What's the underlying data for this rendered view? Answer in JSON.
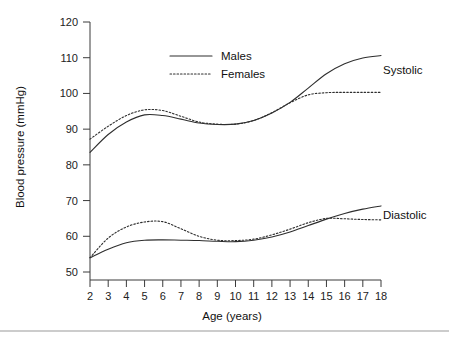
{
  "chart_data": {
    "type": "line",
    "title": "",
    "xlabel": "Age (years)",
    "ylabel": "Blood pressure (mmHg)",
    "xlim": [
      2,
      18
    ],
    "ylim": [
      50,
      120
    ],
    "grid": false,
    "legend_position": "top-center",
    "x_ticks": [
      "2",
      "3",
      "4",
      "5",
      "6",
      "7",
      "8",
      "9",
      "10",
      "11",
      "12",
      "13",
      "14",
      "15",
      "16",
      "17",
      "18"
    ],
    "y_ticks": [
      "50",
      "60",
      "70",
      "80",
      "90",
      "100",
      "110",
      "120"
    ],
    "legend": [
      {
        "name": "Males",
        "style": "solid"
      },
      {
        "name": "Females",
        "style": "dotted"
      }
    ],
    "group_labels": [
      {
        "name": "Systolic",
        "value_label": "Systolic"
      },
      {
        "name": "Diastolic",
        "value_label": "Diastolic"
      }
    ],
    "x": [
      2,
      3,
      4,
      5,
      6,
      7,
      8,
      9,
      10,
      11,
      12,
      13,
      14,
      15,
      16,
      17,
      18
    ],
    "series": [
      {
        "name": "Systolic Males",
        "group": "Systolic",
        "sex": "Males",
        "style": "solid",
        "values": [
          83.5,
          88.5,
          92.0,
          94.0,
          93.8,
          92.8,
          91.7,
          91.3,
          91.4,
          92.4,
          94.5,
          97.5,
          101.5,
          105.5,
          108.3,
          109.9,
          110.6
        ]
      },
      {
        "name": "Systolic Females",
        "group": "Systolic",
        "sex": "Females",
        "style": "dotted",
        "values": [
          87.2,
          90.8,
          93.8,
          95.4,
          95.2,
          93.6,
          92.0,
          91.4,
          91.4,
          92.4,
          94.6,
          97.4,
          99.6,
          100.2,
          100.3,
          100.3,
          100.3
        ]
      },
      {
        "name": "Diastolic Males",
        "group": "Diastolic",
        "sex": "Males",
        "style": "solid",
        "values": [
          54.0,
          56.4,
          58.2,
          58.9,
          59.0,
          58.9,
          58.8,
          58.6,
          58.5,
          58.9,
          59.8,
          61.2,
          63.0,
          64.8,
          66.4,
          67.6,
          68.5
        ]
      },
      {
        "name": "Diastolic Females",
        "group": "Diastolic",
        "sex": "Females",
        "style": "dotted",
        "values": [
          54.0,
          59.5,
          62.6,
          64.0,
          64.1,
          62.1,
          60.0,
          58.9,
          58.8,
          59.2,
          60.4,
          62.0,
          63.8,
          65.0,
          64.9,
          64.7,
          64.6
        ]
      }
    ]
  },
  "colors": {
    "line": "#2e2e2e",
    "axis": "#3b3b3b",
    "text": "#111111",
    "background": "#ffffff",
    "footer_rule": "#9a9a9a"
  }
}
